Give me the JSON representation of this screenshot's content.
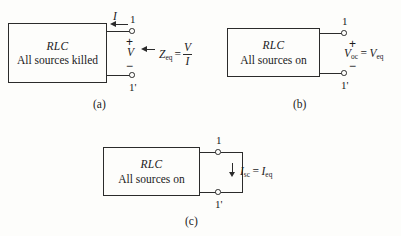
{
  "figure": {
    "background_color": "#fdfdfb",
    "ink_color": "#2b2b2b"
  },
  "panels": [
    {
      "id": "a",
      "caption": "(a)",
      "box": {
        "title": "RLC",
        "subtitle": "All sources killed"
      },
      "terminals": {
        "top_label": "1",
        "bottom_label": "1'"
      },
      "polarity": {
        "plus": "+",
        "minus": "−"
      },
      "current_label": "I",
      "voltage_label": "V",
      "equation": {
        "symbol": "Z",
        "subscript": "eq",
        "equals": "=",
        "numerator": "V",
        "denominator": "I"
      }
    },
    {
      "id": "b",
      "caption": "(b)",
      "box": {
        "title": "RLC",
        "subtitle": "All sources on"
      },
      "terminals": {
        "top_label": "1",
        "bottom_label": "1'"
      },
      "polarity": {
        "plus": "+",
        "minus": "−"
      },
      "equation": {
        "left_symbol": "V",
        "left_subscript": "oc",
        "equals": "=",
        "right_symbol": "V",
        "right_subscript": "eq"
      }
    },
    {
      "id": "c",
      "caption": "(c)",
      "box": {
        "title": "RLC",
        "subtitle": "All sources on"
      },
      "terminals": {
        "top_label": "1",
        "bottom_label": "1'"
      },
      "equation": {
        "left_symbol": "I",
        "left_subscript": "sc",
        "equals": "=",
        "right_symbol": "I",
        "right_subscript": "eq"
      }
    }
  ]
}
